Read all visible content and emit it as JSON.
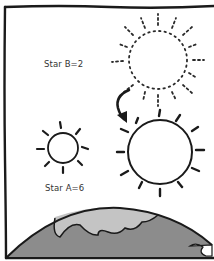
{
  "diagram": {
    "type": "illustration",
    "labels": {
      "star_b": "Star B=2",
      "star_a": "Star A=6"
    },
    "elements": [
      {
        "name": "star-b-dotted",
        "style": "dotted outline",
        "label": "Star B=2"
      },
      {
        "name": "star-b-moved",
        "style": "solid outline",
        "note": "arrow indicates star B moved closer"
      },
      {
        "name": "star-a",
        "style": "solid outline small",
        "label": "Star A=6"
      },
      {
        "name": "earth",
        "style": "shaded arc at bottom"
      }
    ],
    "colors": {
      "ink": "#1a1a1a",
      "earth_land": "#8a8a8a",
      "earth_sea": "#bdbdbd",
      "background": "#ffffff"
    }
  }
}
